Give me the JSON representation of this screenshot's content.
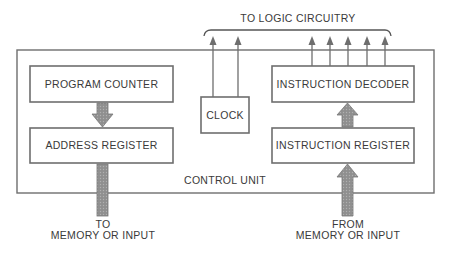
{
  "diagram": {
    "top_label": "TO LOGIC CIRCUITRY",
    "container_label": "CONTROL UNIT",
    "blocks": {
      "program_counter": "PROGRAM COUNTER",
      "address_register": "ADDRESS REGISTER",
      "clock": "CLOCK",
      "instruction_decoder": "INSTRUCTION DECODER",
      "instruction_register": "INSTRUCTION REGISTER"
    },
    "bottom_left_label": {
      "line1": "TO",
      "line2": "MEMORY OR INPUT"
    },
    "bottom_right_label": {
      "line1": "FROM",
      "line2": "MEMORY OR INPUT"
    },
    "colors": {
      "line": "#6e6e6e",
      "bus_fill": "#9a9a9a",
      "text": "#3a3a3a"
    }
  }
}
